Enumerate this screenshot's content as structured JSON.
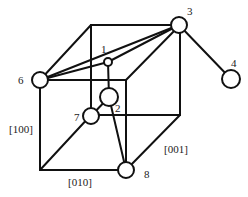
{
  "diagram": {
    "type": "crystal-cube-defect-structure",
    "atoms": [
      {
        "id": "1",
        "label": "1",
        "cx": 108,
        "cy": 62,
        "r": 4,
        "lx": 101,
        "ly": 53
      },
      {
        "id": "2",
        "label": "2",
        "cx": 109,
        "cy": 97,
        "r": 9,
        "lx": 115,
        "ly": 112
      },
      {
        "id": "3",
        "label": "3",
        "cx": 179,
        "cy": 25,
        "r": 8,
        "lx": 187,
        "ly": 15
      },
      {
        "id": "4",
        "label": "4",
        "cx": 231,
        "cy": 79,
        "r": 9,
        "lx": 231,
        "ly": 67
      },
      {
        "id": "6",
        "label": "6",
        "cx": 40,
        "cy": 80,
        "r": 8,
        "lx": 18,
        "ly": 84
      },
      {
        "id": "7",
        "label": "7",
        "cx": 91,
        "cy": 116,
        "r": 8,
        "lx": 74,
        "ly": 121
      },
      {
        "id": "8",
        "label": "8",
        "cx": 126,
        "cy": 170,
        "r": 8,
        "lx": 144,
        "ly": 178
      }
    ],
    "cube_edges": [
      [
        91,
        25,
        180,
        25
      ],
      [
        180,
        25,
        180,
        115
      ],
      [
        180,
        115,
        91,
        115
      ],
      [
        91,
        115,
        91,
        25
      ],
      [
        40,
        80,
        126,
        80
      ],
      [
        126,
        80,
        126,
        170
      ],
      [
        126,
        170,
        40,
        170
      ],
      [
        40,
        170,
        40,
        80
      ],
      [
        40,
        80,
        91,
        25
      ],
      [
        180,
        25,
        126,
        80
      ],
      [
        180,
        115,
        126,
        170
      ],
      [
        40,
        170,
        91,
        115
      ]
    ],
    "bonds": [
      [
        40,
        80,
        179,
        25
      ],
      [
        40,
        80,
        108,
        62
      ],
      [
        108,
        62,
        179,
        25
      ],
      [
        179,
        25,
        231,
        79
      ],
      [
        108,
        62,
        109,
        97
      ],
      [
        109,
        97,
        91,
        116
      ],
      [
        109,
        97,
        126,
        170
      ]
    ],
    "axis_labels": [
      {
        "text": "[100]",
        "x": 9,
        "y": 133
      },
      {
        "text": "[010]",
        "x": 68,
        "y": 186
      },
      {
        "text": "[001]",
        "x": 164,
        "y": 153
      }
    ]
  }
}
